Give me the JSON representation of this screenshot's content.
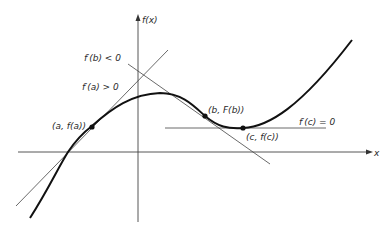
{
  "diagram": {
    "axes": {
      "y_label": "f(x)",
      "x_label": "x"
    },
    "points": [
      {
        "id": "a",
        "label": "(a, f(a))",
        "x": 92,
        "y": 127
      },
      {
        "id": "b",
        "label": "(b, F(b))",
        "x": 205,
        "y": 116
      },
      {
        "id": "c",
        "label": "(c, f(c))",
        "x": 243,
        "y": 128
      }
    ],
    "annotations": {
      "slope_b": "f′(b) < 0",
      "slope_a": "f′(a) > 0",
      "slope_c": "f′(c) = 0"
    },
    "colors": {
      "curve": "#1a1a1a",
      "lines": "#3a3a3a",
      "background": "#ffffff"
    }
  }
}
